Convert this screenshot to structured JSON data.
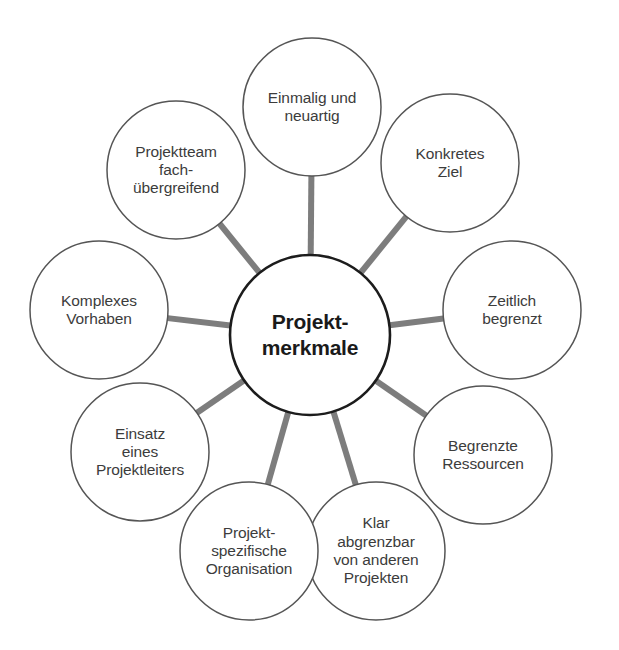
{
  "canvas": {
    "width": 619,
    "height": 650,
    "background": "#ffffff"
  },
  "style": {
    "center_stroke": "#1c1c1c",
    "center_stroke_width": 2.6,
    "satellite_stroke": "#555555",
    "satellite_stroke_width": 1.5,
    "connector_color": "#7d7d7d",
    "connector_width": 6,
    "circle_fill": "#ffffff",
    "center_text_color": "#1a1a1a",
    "satellite_text_color": "#3c3c3c"
  },
  "chart_data": {
    "type": "diagram",
    "subtype": "hub-and-spoke",
    "center": {
      "label": "Projekt-\nmerkmale",
      "cx": 310,
      "cy": 335,
      "r": 80
    },
    "nodes": [
      {
        "id": "einmalig",
        "label": "Einmalig und\nneuartig",
        "cx": 312,
        "cy": 107,
        "r": 69,
        "angle_deg": -90
      },
      {
        "id": "konkretes-ziel",
        "label": "Konkretes\nZiel",
        "cx": 450,
        "cy": 163,
        "r": 69,
        "angle_deg": -50
      },
      {
        "id": "zeitlich",
        "label": "Zeitlich\nbegrenzt",
        "cx": 512,
        "cy": 310,
        "r": 69,
        "angle_deg": -10
      },
      {
        "id": "ressourcen",
        "label": "Begrenzte\nRessourcen",
        "cx": 483,
        "cy": 455,
        "r": 69,
        "angle_deg": 30
      },
      {
        "id": "abgrenzbar",
        "label": "Klar\nabgrenzbar\nvon anderen\nProjekten",
        "cx": 376,
        "cy": 551,
        "r": 69,
        "angle_deg": 66
      },
      {
        "id": "organisation",
        "label": "Projekt-\nspezifische\nOrganisation",
        "cx": 249,
        "cy": 551,
        "r": 69,
        "angle_deg": 114
      },
      {
        "id": "projektleiter",
        "label": "Einsatz\neines\nProjektleiters",
        "cx": 140,
        "cy": 452,
        "r": 69,
        "angle_deg": 150
      },
      {
        "id": "komplexes",
        "label": "Komplexes\nVorhaben",
        "cx": 99,
        "cy": 310,
        "r": 69,
        "angle_deg": 190
      },
      {
        "id": "projektteam",
        "label": "Projektteam\nfach-\nübergreifend",
        "cx": 176,
        "cy": 170,
        "r": 69,
        "angle_deg": 230
      }
    ],
    "connector_count": 9,
    "legend": [],
    "annotations": []
  },
  "caption": {
    "text": "",
    "visible": false
  }
}
